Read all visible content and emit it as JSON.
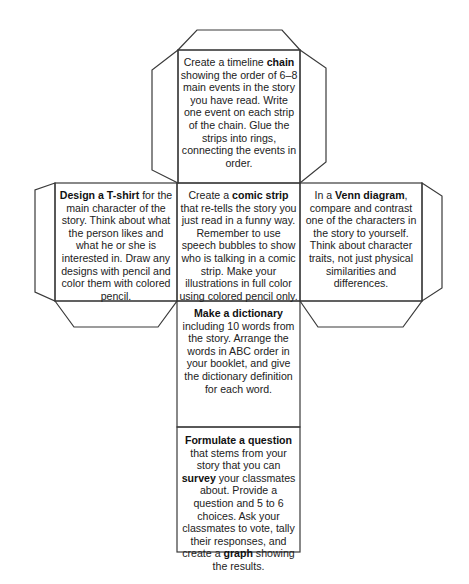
{
  "document": {
    "type": "cube-net-activity",
    "faces": {
      "top": {
        "pre": "Create a timeline ",
        "bold1": "chain",
        "post": " showing the order of 6–8 main events in the story you have read. Write one event on each strip of the chain. Glue the strips into rings, connecting the events in order."
      },
      "left": {
        "bold1": "Design a T-shirt",
        "post": " for the main character of the story. Think about what the person likes and what he or she is interested in. Draw any designs with pencil and color them with colored pencil."
      },
      "center": {
        "pre": "Create a ",
        "bold1": "comic strip",
        "post": " that re-tells the story you just read in a funny way. Remember to use speech bubbles to show who is talking in a comic strip. Make your illustrations in full color using colored pencil only."
      },
      "right": {
        "pre": "In a ",
        "bold1": "Venn diagram",
        "post": ", compare and contrast one of the characters in the story to yourself. Think about character traits, not just physical similarities and differences."
      },
      "dictionary": {
        "bold1": "Make a dictionary",
        "post": " including 10 words from the story. Arrange the words in ABC order in your booklet, and give the dictionary definition for each word."
      },
      "bottom": {
        "bold1": "Formulate a question",
        "mid1": " that stems from your story that you can ",
        "bold2": "survey",
        "mid2": " your classmates about. Provide a question and 5 to 6 choices. Ask your classmates to vote, tally their responses, and create a ",
        "bold3": "graph",
        "post": " showing the results."
      }
    },
    "colors": {
      "line": "#3a3a3a",
      "text": "#222222",
      "background": "#ffffff"
    }
  }
}
